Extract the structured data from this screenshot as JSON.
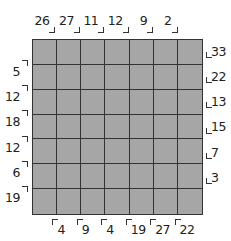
{
  "puzzle": {
    "type": "skyscraper-sum",
    "size": 7,
    "cell_color": "#a6a6a6",
    "grid_line_color": "#333333",
    "top_clues": [
      "26",
      "27",
      "11",
      "12",
      "9",
      "2",
      ""
    ],
    "bottom_clues": [
      "",
      "4",
      "9",
      "4",
      "19",
      "27",
      "22"
    ],
    "left_clues": [
      "",
      "5",
      "12",
      "18",
      "12",
      "6",
      "19"
    ],
    "right_clues": [
      "33",
      "22",
      "13",
      "15",
      "7",
      "3",
      ""
    ]
  }
}
